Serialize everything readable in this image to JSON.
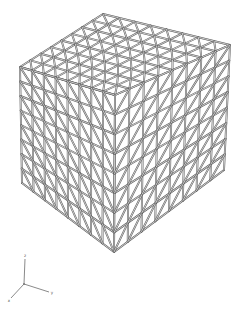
{
  "figure": {
    "cells_per_edge": 8,
    "colors": {
      "strut": "#5a5a5a",
      "background": "#ffffff",
      "axis": "#8a8a8a"
    },
    "corners": {
      "top_back": [
        103,
        14
      ],
      "top_left": [
        20,
        67
      ],
      "top_front": [
        115,
        95
      ],
      "top_right": [
        230,
        45
      ],
      "bottom_left": [
        22,
        183
      ],
      "bottom_front": [
        114,
        252
      ],
      "bottom_right": [
        224,
        170
      ]
    },
    "faces": [
      {
        "name": "top",
        "origin": "top_left",
        "u": "top_front",
        "v": "top_back"
      },
      {
        "name": "left",
        "origin": "top_left",
        "u": "top_front",
        "v": "bottom_left"
      },
      {
        "name": "right",
        "origin": "top_front",
        "u": "top_right",
        "v": "bottom_front"
      }
    ]
  },
  "axes": {
    "origin": [
      24,
      284
    ],
    "items": [
      {
        "label": "z",
        "end": [
          25,
          259
        ]
      },
      {
        "label": "y",
        "end": [
          49,
          292
        ]
      },
      {
        "label": "x",
        "end": [
          11,
          298
        ]
      }
    ]
  }
}
